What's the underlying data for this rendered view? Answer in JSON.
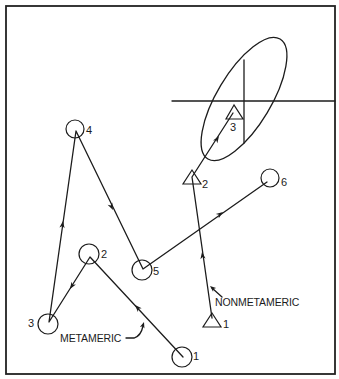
{
  "figure": {
    "annotations": {
      "metameric": "METAMERIC",
      "nonmetameric": "NONMETAMERIC"
    },
    "metameric_series": {
      "marker": "circle",
      "path_order": [
        "1",
        "2",
        "3",
        "4",
        "5",
        "6"
      ],
      "points": [
        {
          "label": "1"
        },
        {
          "label": "2"
        },
        {
          "label": "3"
        },
        {
          "label": "4"
        },
        {
          "label": "5"
        },
        {
          "label": "6"
        }
      ]
    },
    "nonmetameric_series": {
      "marker": "triangle",
      "path_order": [
        "1",
        "2",
        "3"
      ],
      "points": [
        {
          "label": "1"
        },
        {
          "label": "2"
        },
        {
          "label": "3"
        }
      ]
    },
    "tolerance_region": {
      "shape": "ellipse",
      "crosshair": true,
      "contains": "triangle 3"
    }
  },
  "colors": {
    "ink": "#1c1c1c",
    "background": "#ffffff"
  }
}
